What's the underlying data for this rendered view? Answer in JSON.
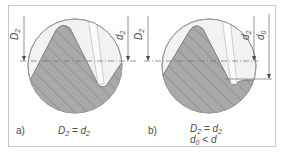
{
  "colors": {
    "frame": "#c8c8c8",
    "circle_fill": "#f2f2f2",
    "circle_stroke": "#9a9a9a",
    "hatch_fill": "#a9a9a9",
    "hatch_line": "#7e7e7e",
    "lines": "#6a6a6a",
    "text": "#4a4a4a"
  },
  "panels": [
    {
      "id": "a",
      "label": "a)",
      "equations": [
        {
          "main": "D",
          "sub": "2",
          "op": " = ",
          "main2": "d",
          "sub2": "2"
        }
      ],
      "dimensions": [
        {
          "symbol": "D",
          "sub": "2",
          "side": "left"
        },
        {
          "symbol": "d",
          "sub": "2",
          "side": "right"
        }
      ]
    },
    {
      "id": "b",
      "label": "b)",
      "equations": [
        {
          "main": "D",
          "sub": "2",
          "op": " = ",
          "main2": "d",
          "sub2": "2"
        },
        {
          "main": "d",
          "sub": "0",
          "op": " < ",
          "main2": "d",
          "sub2": ""
        }
      ],
      "dimensions": [
        {
          "symbol": "D",
          "sub": "2",
          "side": "left"
        },
        {
          "symbol": "d",
          "sub": "2",
          "side": "right"
        },
        {
          "symbol": "d",
          "sub": "0",
          "side": "right-outer"
        }
      ]
    }
  ]
}
